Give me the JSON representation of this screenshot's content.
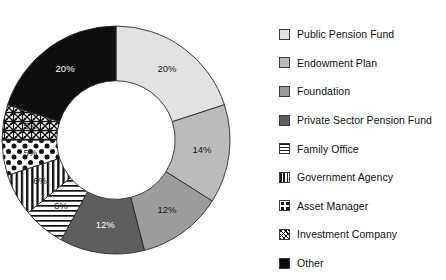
{
  "chart_data": {
    "type": "pie",
    "variant": "donut",
    "title": "",
    "xlabel": "",
    "ylabel": "",
    "legend_position": "right",
    "grid": false,
    "start_angle_deg": 0,
    "direction": "clockwise",
    "inner_radius_ratio": 0.52,
    "value_unit": "%",
    "categories": [
      "Public Pension Fund",
      "Endowment Plan",
      "Foundation",
      "Private Sector Pension Fund",
      "Family Office",
      "Government Agency",
      "Asset Manager",
      "Investment Company",
      "Other"
    ],
    "values": [
      20,
      14,
      12,
      12,
      6,
      6,
      5,
      5,
      20
    ],
    "data_labels": [
      "20%",
      "14%",
      "12%",
      "12%",
      "6%",
      "6%",
      "5%",
      "5%",
      "20%"
    ],
    "slices": [
      {
        "label": "Public Pension Fund",
        "value": 20,
        "data_label": "20%",
        "fill": "#E2E2E2",
        "pattern": "solid",
        "label_on_dark": false
      },
      {
        "label": "Endowment Plan",
        "value": 14,
        "data_label": "14%",
        "fill": "#BBBBBB",
        "pattern": "solid",
        "label_on_dark": false
      },
      {
        "label": "Foundation",
        "value": 12,
        "data_label": "12%",
        "fill": "#9C9C9C",
        "pattern": "solid",
        "label_on_dark": false
      },
      {
        "label": "Private Sector Pension Fund",
        "value": 12,
        "data_label": "12%",
        "fill": "#5E5E5E",
        "pattern": "solid",
        "label_on_dark": true
      },
      {
        "label": "Family Office",
        "value": 6,
        "data_label": "6%",
        "fill": "#FFFFFF",
        "pattern": "hlines",
        "label_on_dark": false
      },
      {
        "label": "Government Agency",
        "value": 6,
        "data_label": "6%",
        "fill": "#FFFFFF",
        "pattern": "vlines",
        "label_on_dark": false
      },
      {
        "label": "Asset Manager",
        "value": 5,
        "data_label": "5%",
        "fill": "#FFFFFF",
        "pattern": "dots",
        "label_on_dark": false
      },
      {
        "label": "Investment Company",
        "value": 5,
        "data_label": "5%",
        "fill": "#FFFFFF",
        "pattern": "scribble",
        "label_on_dark": false
      },
      {
        "label": "Other",
        "value": 20,
        "data_label": "20%",
        "fill": "#0D0D0D",
        "pattern": "solid",
        "label_on_dark": true
      }
    ]
  },
  "legend": {
    "items": [
      {
        "label": "Public Pension Fund",
        "swatch": "sw-solid",
        "color": "#E2E2E2"
      },
      {
        "label": "Endowment Plan",
        "swatch": "sw-solid",
        "color": "#BBBBBB"
      },
      {
        "label": "Foundation",
        "swatch": "sw-solid",
        "color": "#9C9C9C"
      },
      {
        "label": "Private Sector Pension Fund",
        "swatch": "sw-solid",
        "color": "#5E5E5E"
      },
      {
        "label": "Family Office",
        "swatch": "sw-hlines",
        "color": "#FFFFFF"
      },
      {
        "label": "Government Agency",
        "swatch": "sw-vlines",
        "color": "#FFFFFF"
      },
      {
        "label": "Asset Manager",
        "swatch": "sw-dots",
        "color": "#FFFFFF"
      },
      {
        "label": "Investment Company",
        "swatch": "sw-scribble",
        "color": "#FFFFFF"
      },
      {
        "label": "Other",
        "swatch": "sw-solid",
        "color": "#0D0D0D"
      }
    ]
  },
  "colors": {
    "background": "#FFFFFF",
    "outline": "#2A2A2A",
    "text": "#111111"
  }
}
